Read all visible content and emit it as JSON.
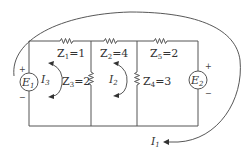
{
  "diagram": {
    "type": "electric-circuit",
    "sources": [
      {
        "id": "E1",
        "name": "E",
        "sub": "1",
        "polarity_top": "+",
        "polarity_bottom": "−"
      },
      {
        "id": "E2",
        "name": "E",
        "sub": "2",
        "polarity_top": "+",
        "polarity_bottom": "−"
      }
    ],
    "impedances": [
      {
        "id": "Z1",
        "name": "Z",
        "sub": "1",
        "value": "=1"
      },
      {
        "id": "Z2",
        "name": "Z",
        "sub": "2",
        "value": "=4"
      },
      {
        "id": "Z3",
        "name": "Z",
        "sub": "3",
        "value": "=2"
      },
      {
        "id": "Z4",
        "name": "Z",
        "sub": "4",
        "value": "=3"
      },
      {
        "id": "Z5",
        "name": "Z",
        "sub": "5",
        "value": "=2"
      }
    ],
    "currents": [
      {
        "id": "I1",
        "name": "I",
        "sub": "1"
      },
      {
        "id": "I2",
        "name": "I",
        "sub": "2"
      },
      {
        "id": "I3",
        "name": "I",
        "sub": "3"
      }
    ]
  }
}
